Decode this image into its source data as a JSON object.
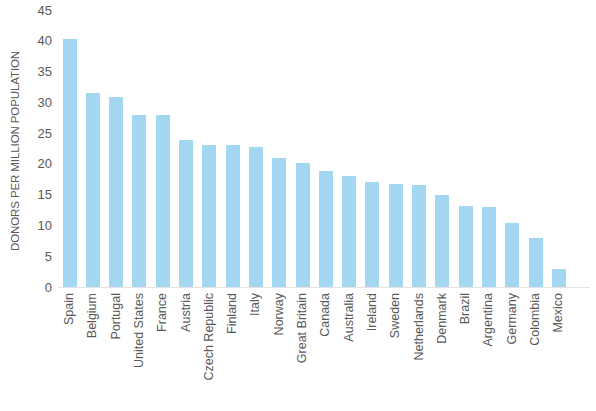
{
  "chart_data": {
    "type": "bar",
    "title": "",
    "subtitle": "",
    "xlabel": "",
    "ylabel": "DONORS PER MILLION POPULATION",
    "ylim": [
      0,
      45
    ],
    "ytick_step": 5,
    "yticks": [
      "45",
      "40",
      "35",
      "30",
      "25",
      "20",
      "15",
      "10",
      "5",
      "0"
    ],
    "grid": false,
    "legend": null,
    "bar_color": "#a4d7f2",
    "text_color": "#595959",
    "background_color": "#ffffff",
    "categories": [
      "Spain",
      "Belgium",
      "Portugal",
      "United States",
      "France",
      "Austria",
      "Czech Republic",
      "Finland",
      "Italy",
      "Norway",
      "Great Britain",
      "Canada",
      "Australia",
      "Ireland",
      "Sweden",
      "Netherlands",
      "Denmark",
      "Brazil",
      "Argentina",
      "Germany",
      "Colombia",
      "Mexico"
    ],
    "values": [
      40.3,
      31.6,
      30.8,
      28.0,
      28.0,
      23.9,
      23.0,
      23.0,
      22.7,
      21.0,
      20.1,
      18.8,
      18.0,
      17.0,
      16.8,
      16.5,
      15.0,
      13.2,
      13.0,
      10.4,
      8.0,
      3.0
    ]
  }
}
